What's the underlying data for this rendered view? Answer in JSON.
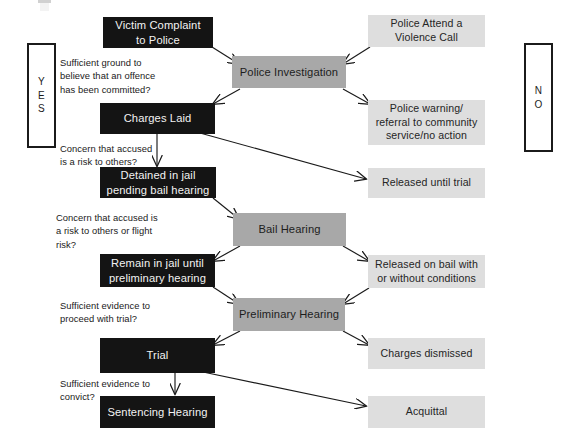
{
  "diagram": {
    "colors": {
      "dark_node": "#141414",
      "mid_node": "#a8a8a8",
      "light_node": "#dedede",
      "text_on_dark": "#f2f2f2",
      "text_on_light": "#252525",
      "arrow": "#1a1a1a",
      "background": "#ffffff"
    },
    "side_labels": [
      {
        "name": "yes",
        "text": "Y\nE\nS"
      },
      {
        "name": "no",
        "text": "N\nO"
      }
    ],
    "nodes": [
      {
        "id": "victim-complaint",
        "style": "dark",
        "lines": [
          "Victim Complaint",
          "to Police"
        ]
      },
      {
        "id": "police-attend",
        "style": "light",
        "lines": [
          "Police Attend a",
          "Violence Call"
        ]
      },
      {
        "id": "police-investigation",
        "style": "mid",
        "lines": [
          "Police Investigation"
        ]
      },
      {
        "id": "charges-laid",
        "style": "dark",
        "lines": [
          "Charges Laid"
        ]
      },
      {
        "id": "police-warning",
        "style": "light",
        "lines": [
          "Police warning/",
          "referral to community",
          "service/no action"
        ]
      },
      {
        "id": "detained-in-jail",
        "style": "dark",
        "lines": [
          "Detained in jail",
          "pending bail hearing"
        ]
      },
      {
        "id": "released-until-trial",
        "style": "light",
        "lines": [
          "Released until trial"
        ]
      },
      {
        "id": "bail-hearing",
        "style": "mid",
        "lines": [
          "Bail Hearing"
        ]
      },
      {
        "id": "remain-in-jail",
        "style": "dark",
        "lines": [
          "Remain in jail until",
          "preliminary hearing"
        ]
      },
      {
        "id": "released-on-bail",
        "style": "light",
        "lines": [
          "Released on bail with",
          "or without conditions"
        ]
      },
      {
        "id": "preliminary-hearing",
        "style": "mid",
        "lines": [
          "Preliminary Hearing"
        ]
      },
      {
        "id": "trial",
        "style": "dark",
        "lines": [
          "Trial"
        ]
      },
      {
        "id": "charges-dismissed",
        "style": "light",
        "lines": [
          "Charges dismissed"
        ]
      },
      {
        "id": "sentencing-hearing",
        "style": "dark",
        "lines": [
          "Sentencing Hearing"
        ]
      },
      {
        "id": "acquittal",
        "style": "light",
        "lines": [
          "Acquittal"
        ]
      }
    ],
    "conditions": [
      {
        "id": "cond-offence-committed",
        "lines": [
          "Sufficient ground to",
          "believe that an offence",
          "has been committed?"
        ]
      },
      {
        "id": "cond-risk-to-others",
        "lines": [
          "Concern that accused",
          "is a risk to others?"
        ]
      },
      {
        "id": "cond-risk-or-flight",
        "lines": [
          "Concern that accused is",
          "a risk to others or flight",
          "risk?"
        ]
      },
      {
        "id": "cond-proceed-trial",
        "lines": [
          "Sufficient evidence to",
          "proceed with trial?"
        ]
      },
      {
        "id": "cond-convict",
        "lines": [
          "Sufficient evidence to",
          "convict?"
        ]
      }
    ]
  }
}
